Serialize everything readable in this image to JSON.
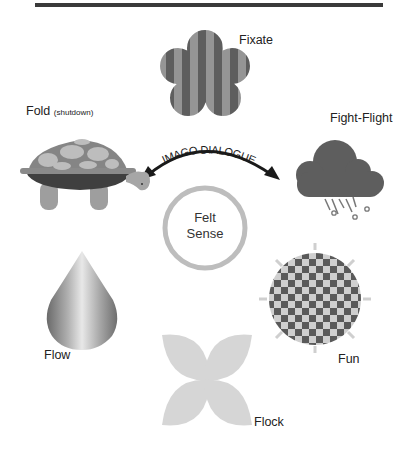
{
  "diagram": {
    "center": {
      "line1": "Felt",
      "line2": "Sense"
    },
    "arc_label": "IMAGO DIALOGUE",
    "nodes": [
      {
        "id": "fixate",
        "label": "Fixate",
        "icon": "striped-flower-icon"
      },
      {
        "id": "fight-flight",
        "label": "Fight-Flight",
        "icon": "storm-cloud-icon"
      },
      {
        "id": "fun",
        "label": "Fun",
        "icon": "checkered-sun-icon"
      },
      {
        "id": "flock",
        "label": "Flock",
        "icon": "four-petal-icon"
      },
      {
        "id": "flow",
        "label": "Flow",
        "icon": "water-drop-icon"
      },
      {
        "id": "fold",
        "label": "Fold",
        "sublabel": "(shutdown)",
        "icon": "turtle-icon"
      }
    ]
  },
  "colors": {
    "dark_gray": "#5c5c5c",
    "mid_gray": "#8e8e8e",
    "light_gray": "#c6c6c6",
    "ring_gray": "#b8b8b8",
    "bar": "#3a3a3a"
  }
}
